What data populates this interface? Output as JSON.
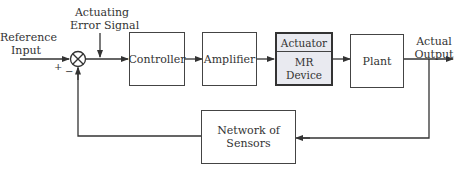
{
  "diagram": {
    "labels": {
      "reference_input_line1": "Reference",
      "reference_input_line2": "Input",
      "error_signal_line1": "Actuating",
      "error_signal_line2": "Error Signal",
      "actual_output_line1": "Actual",
      "actual_output_line2": "Output",
      "plus": "+",
      "minus": "−"
    },
    "blocks": {
      "controller": "Controller",
      "amplifier": "Amplifier",
      "actuator_top": "Actuator",
      "actuator_bottom_line1": "MR",
      "actuator_bottom_line2": "Device",
      "plant": "Plant",
      "sensors_line1": "Network of",
      "sensors_line2": "Sensors"
    },
    "colors": {
      "line": "#333333",
      "mr_device_fill": "#e9eaf0"
    }
  }
}
